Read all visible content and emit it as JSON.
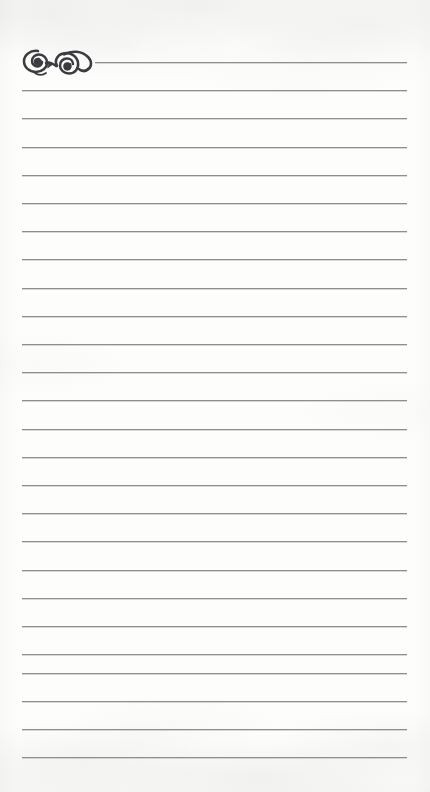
{
  "document": {
    "kind": "lined-notepaper",
    "page_label": "",
    "width": 430,
    "height": 792
  },
  "colors": {
    "paper": "#fdfdfc",
    "rule": "#8e8e90",
    "rule_highlight": "#aaaaae",
    "ornament": "#3c3c40",
    "ornament_shadow": "#6a6a6e"
  },
  "ornament": {
    "name": "calligraphic-flourish",
    "description": "double spiral calligraphic flourish",
    "x": 20,
    "y": 44,
    "width": 76,
    "height": 36
  },
  "ruling": {
    "count": 25,
    "first_y": 62,
    "spacing": 28.2,
    "left": 22,
    "right": 407,
    "first_line_left": 95,
    "thickness": 1,
    "lines": [
      {
        "y": 62,
        "left": 95,
        "right": 407
      },
      {
        "y": 90,
        "left": 22,
        "right": 407
      },
      {
        "y": 118,
        "left": 22,
        "right": 407
      },
      {
        "y": 147,
        "left": 22,
        "right": 407
      },
      {
        "y": 175,
        "left": 22,
        "right": 407
      },
      {
        "y": 203,
        "left": 22,
        "right": 407
      },
      {
        "y": 231,
        "left": 22,
        "right": 407
      },
      {
        "y": 259,
        "left": 22,
        "right": 407
      },
      {
        "y": 288,
        "left": 22,
        "right": 407
      },
      {
        "y": 316,
        "left": 22,
        "right": 407
      },
      {
        "y": 344,
        "left": 22,
        "right": 407
      },
      {
        "y": 372,
        "left": 22,
        "right": 407
      },
      {
        "y": 400,
        "left": 22,
        "right": 407
      },
      {
        "y": 429,
        "left": 22,
        "right": 407
      },
      {
        "y": 457,
        "left": 22,
        "right": 407
      },
      {
        "y": 485,
        "left": 22,
        "right": 407
      },
      {
        "y": 513,
        "left": 22,
        "right": 407
      },
      {
        "y": 541,
        "left": 22,
        "right": 407
      },
      {
        "y": 570,
        "left": 22,
        "right": 407
      },
      {
        "y": 598,
        "left": 22,
        "right": 407
      },
      {
        "y": 626,
        "left": 22,
        "right": 407
      },
      {
        "y": 654,
        "left": 22,
        "right": 407
      },
      {
        "y": 673,
        "left": 22,
        "right": 407
      },
      {
        "y": 701,
        "left": 22,
        "right": 407
      },
      {
        "y": 729,
        "left": 22,
        "right": 407
      },
      {
        "y": 757,
        "left": 22,
        "right": 407
      }
    ]
  }
}
